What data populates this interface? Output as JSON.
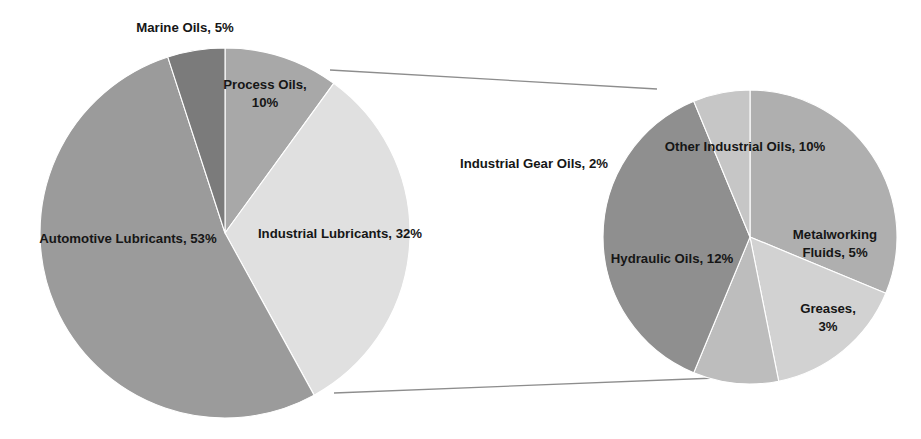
{
  "chart_data": {
    "type": "pie",
    "title": "",
    "subtitle": "",
    "legend": "none",
    "note": "Pie-of-pie chart: the Industrial Lubricants slice of the main pie is exploded into the secondary pie on the right.",
    "charts": [
      {
        "name": "main-pie",
        "id": "main",
        "total": 100,
        "units": "%",
        "start_angle_deg": 0,
        "direction": "clockwise",
        "center": {
          "x": 225,
          "y": 233
        },
        "radius": 185,
        "categories": [
          "Process Oils",
          "Industrial Lubricants",
          "Automotive Lubricants",
          "Marine Oils"
        ],
        "values": [
          10,
          32,
          53,
          5
        ],
        "slices": [
          {
            "label": "Process Oils, 10%",
            "name": "Process Oils",
            "value": 10,
            "color": "#a8a8a8",
            "label_lines": [
              "Process Oils,",
              "10%"
            ],
            "label_x": 265,
            "label_y": 86,
            "label_size": "normal"
          },
          {
            "label": "Industrial Lubricants, 32%",
            "name": "Industrial Lubricants",
            "value": 32,
            "color": "#e0e0e0",
            "label_lines": [
              "Industrial Lubricants, 32%"
            ],
            "label_x": 340,
            "label_y": 235,
            "label_size": "normal"
          },
          {
            "label": "Automotive Lubricants, 53%",
            "name": "Automotive Lubricants",
            "value": 53,
            "color": "#9b9b9b",
            "label_lines": [
              "Automotive Lubricants, 53%"
            ],
            "label_x": 128,
            "label_y": 240,
            "label_size": "normal"
          },
          {
            "label": "Marine Oils, 5%",
            "name": "Marine Oils",
            "value": 5,
            "color": "#7b7b7b",
            "label_lines": [
              "Marine Oils, 5%"
            ],
            "label_x": 185,
            "label_y": 29,
            "label_size": "normal"
          }
        ]
      },
      {
        "name": "secondary-pie",
        "id": "secondary",
        "total": 32,
        "units": "%",
        "parent_slice": "Industrial Lubricants",
        "start_angle_deg": 0,
        "direction": "clockwise",
        "center": {
          "x": 750,
          "y": 237
        },
        "radius": 147,
        "categories": [
          "Other Industrial Oils",
          "Metalworking Fluids",
          "Greases",
          "Hydraulic Oils",
          "Industrial Gear Oils"
        ],
        "values": [
          10,
          5,
          3,
          12,
          2
        ],
        "slices": [
          {
            "label": "Other Industrial Oils, 10%",
            "name": "Other Industrial Oils",
            "value": 10,
            "color": "#afafaf",
            "label_lines": [
              "Other Industrial Oils, 10%"
            ],
            "label_x": 745,
            "label_y": 148,
            "label_size": "normal"
          },
          {
            "label": "Metalworking Fluids, 5%",
            "name": "Metalworking Fluids",
            "value": 5,
            "color": "#d2d2d2",
            "label_lines": [
              "Metalworking",
              "Fluids, 5%"
            ],
            "label_x": 835,
            "label_y": 236,
            "label_size": "normal"
          },
          {
            "label": "Greases, 3%",
            "name": "Greases",
            "value": 3,
            "color": "#bdbdbd",
            "label_lines": [
              "Greases,",
              "3%"
            ],
            "label_x": 828,
            "label_y": 310,
            "label_size": "normal"
          },
          {
            "label": "Hydraulic Oils, 12%",
            "name": "Hydraulic Oils",
            "value": 12,
            "color": "#8f8f8f",
            "label_lines": [
              "Hydraulic Oils, 12%"
            ],
            "label_x": 672,
            "label_y": 260,
            "label_size": "normal"
          },
          {
            "label": "Industrial Gear Oils, 2%",
            "name": "Industrial Gear Oils",
            "value": 2,
            "color": "#c6c6c6",
            "label_lines": [
              "Industrial Gear Oils, 2%"
            ],
            "label_x": 534,
            "label_y": 165,
            "label_size": "normal"
          }
        ]
      }
    ],
    "connectors": [
      {
        "name": "connector-top",
        "x1": 330,
        "y1": 70,
        "x2": 657,
        "y2": 89
      },
      {
        "name": "connector-bottom",
        "x1": 334,
        "y1": 393,
        "x2": 716,
        "y2": 378
      }
    ],
    "colors": {
      "background": "#ffffff",
      "label_text": "#161616",
      "connector": "#8d8d8d",
      "slice_border": "#ffffff"
    }
  }
}
